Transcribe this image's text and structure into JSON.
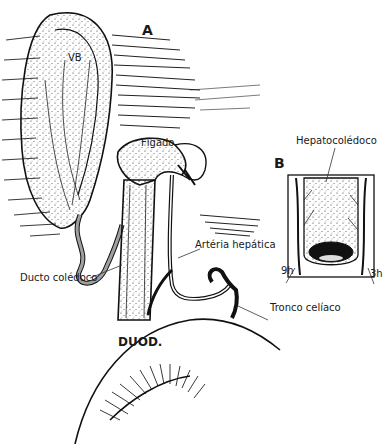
{
  "figure": {
    "panel_a": {
      "letter": "A"
    },
    "panel_b": {
      "letter": "B"
    },
    "labels": {
      "gallbladder": "VB",
      "liver": "Fígado",
      "hepatic_artery": "Artéria hepática",
      "common_bile_duct": "Ducto colédoco",
      "celiac_trunk": "Tronco celíaco",
      "duodenum": "DUOD.",
      "hepatocholedochus": "Hepatocolédoco",
      "clock_9": "9h",
      "clock_3": "3h"
    }
  }
}
